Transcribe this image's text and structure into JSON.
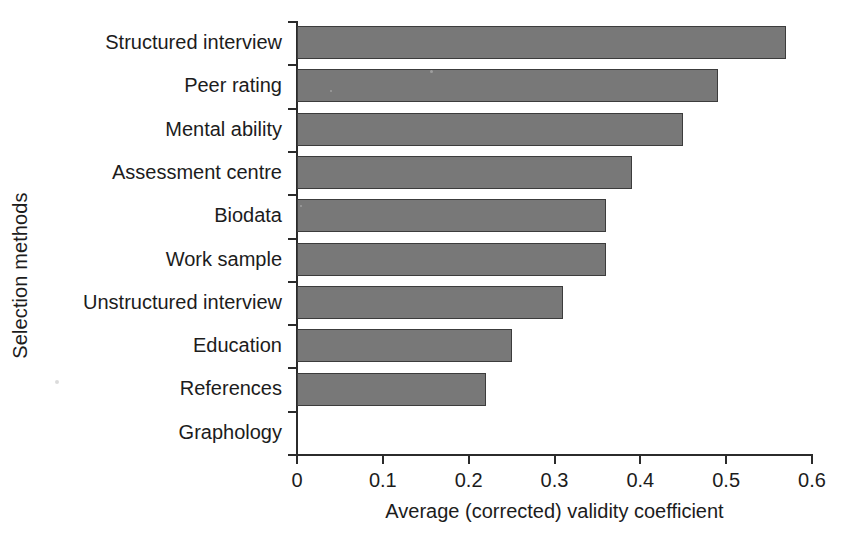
{
  "chart_data": {
    "type": "bar",
    "orientation": "horizontal",
    "title": "",
    "xlabel": "Average (corrected) validity coefficient",
    "ylabel": "Selection methods",
    "categories": [
      "Structured interview",
      "Peer rating",
      "Mental ability",
      "Assessment centre",
      "Biodata",
      "Work sample",
      "Unstructured interview",
      "Education",
      "References",
      "Graphology"
    ],
    "values": [
      0.57,
      0.49,
      0.45,
      0.39,
      0.36,
      0.36,
      0.31,
      0.25,
      0.22,
      0.0
    ],
    "xlim": [
      0,
      0.6
    ],
    "xticks": [
      0,
      0.1,
      0.2,
      0.3,
      0.4,
      0.5,
      0.6
    ],
    "xtick_labels": [
      "0",
      "0.1",
      "0.2",
      "0.3",
      "0.4",
      "0.5",
      "0.6"
    ],
    "grid": false,
    "legend": null,
    "bar_color": "#787878",
    "bar_edge_color": "#3c3c3c",
    "axis_color": "#2b2b2b",
    "background_color": "#ffffff"
  }
}
